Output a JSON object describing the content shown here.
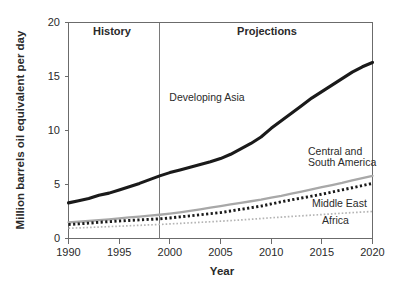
{
  "chart_data": {
    "type": "line",
    "title": "",
    "xlabel": "Year",
    "ylabel": "Million barrels oil equivalent per day",
    "xlim": [
      1990,
      2020
    ],
    "ylim": [
      0,
      20
    ],
    "xticks": [
      "1990",
      "1995",
      "2000",
      "2005",
      "2010",
      "2015",
      "2020"
    ],
    "yticks": [
      "0",
      "5",
      "10",
      "15",
      "20"
    ],
    "grid": false,
    "legend_position": "inline-annotations",
    "x": [
      1990,
      1991,
      1992,
      1993,
      1994,
      1995,
      1996,
      1997,
      1998,
      1999,
      2000,
      2001,
      2002,
      2003,
      2004,
      2005,
      2006,
      2007,
      2008,
      2009,
      2010,
      2011,
      2012,
      2013,
      2014,
      2015,
      2016,
      2017,
      2018,
      2019,
      2020
    ],
    "series": [
      {
        "name": "Developing Asia",
        "style": "solid-thick-black",
        "color": "#1a1a1a",
        "values": [
          3.3,
          3.5,
          3.7,
          4.0,
          4.2,
          4.5,
          4.8,
          5.1,
          5.45,
          5.8,
          6.1,
          6.35,
          6.6,
          6.85,
          7.1,
          7.4,
          7.8,
          8.3,
          8.8,
          9.4,
          10.2,
          10.9,
          11.6,
          12.3,
          13.0,
          13.6,
          14.2,
          14.8,
          15.4,
          15.9,
          16.3
        ]
      },
      {
        "name": "Central and South America",
        "style": "solid-gray",
        "color": "#a8a8a8",
        "values": [
          1.5,
          1.55,
          1.62,
          1.7,
          1.78,
          1.86,
          1.95,
          2.03,
          2.12,
          2.2,
          2.3,
          2.42,
          2.55,
          2.7,
          2.85,
          3.0,
          3.15,
          3.3,
          3.45,
          3.6,
          3.78,
          3.95,
          4.15,
          4.35,
          4.55,
          4.75,
          4.95,
          5.15,
          5.38,
          5.6,
          5.8
        ]
      },
      {
        "name": "Middle East",
        "style": "dotted-thick-black",
        "color": "#1a1a1a",
        "values": [
          1.3,
          1.35,
          1.42,
          1.5,
          1.56,
          1.62,
          1.67,
          1.72,
          1.77,
          1.82,
          1.9,
          2.0,
          2.1,
          2.2,
          2.3,
          2.4,
          2.55,
          2.7,
          2.85,
          3.0,
          3.2,
          3.4,
          3.58,
          3.75,
          3.92,
          4.1,
          4.3,
          4.5,
          4.7,
          4.9,
          5.1
        ]
      },
      {
        "name": "Africa",
        "style": "dotted-thin-gray",
        "color": "#b4b4b4",
        "values": [
          0.95,
          0.98,
          1.02,
          1.06,
          1.1,
          1.14,
          1.18,
          1.22,
          1.26,
          1.3,
          1.35,
          1.4,
          1.45,
          1.5,
          1.55,
          1.6,
          1.66,
          1.72,
          1.78,
          1.85,
          1.92,
          1.98,
          2.04,
          2.1,
          2.16,
          2.22,
          2.28,
          2.34,
          2.4,
          2.45,
          2.5
        ]
      }
    ],
    "annotations": [
      {
        "text": "History",
        "kind": "period-label",
        "x": 1994.3,
        "y": 19.1
      },
      {
        "text": "Projections",
        "kind": "period-label",
        "x": 2009.5,
        "y": 19.1
      },
      {
        "text": "Developing Asia",
        "kind": "series-label",
        "x": 2002.5,
        "y": 12.6
      },
      {
        "text": "Central and",
        "kind": "series-label",
        "x": 2013.0,
        "y": 7.6
      },
      {
        "text": "South America",
        "kind": "series-label",
        "x": 2013.0,
        "y": 6.75
      },
      {
        "text": "Middle East",
        "kind": "series-label",
        "x": 2015.0,
        "y": 2.9
      },
      {
        "text": "Africa",
        "kind": "series-label",
        "x": 2016.0,
        "y": 1.45
      }
    ],
    "divider": {
      "x": 1999,
      "label_left": "History",
      "label_right": "Projections"
    }
  },
  "axes": {
    "y_title": "Million barrels oil equivalent per day",
    "x_title": "Year",
    "y_ticks": [
      "20",
      "15",
      "10",
      "5",
      "0"
    ],
    "x_ticks": [
      "1990",
      "1995",
      "2000",
      "2005",
      "2010",
      "2015",
      "2020"
    ]
  },
  "labels": {
    "history": "History",
    "projections": "Projections",
    "developing_asia": "Developing Asia",
    "central_and": "Central and",
    "south_america": "South America",
    "middle_east": "Middle East",
    "africa": "Africa"
  },
  "colors": {
    "developing_asia": "#1a1a1a",
    "central_south_america": "#a8a8a8",
    "middle_east": "#1a1a1a",
    "africa": "#b4b4b4",
    "axis": "#6b6b6b",
    "background": "#ffffff"
  }
}
